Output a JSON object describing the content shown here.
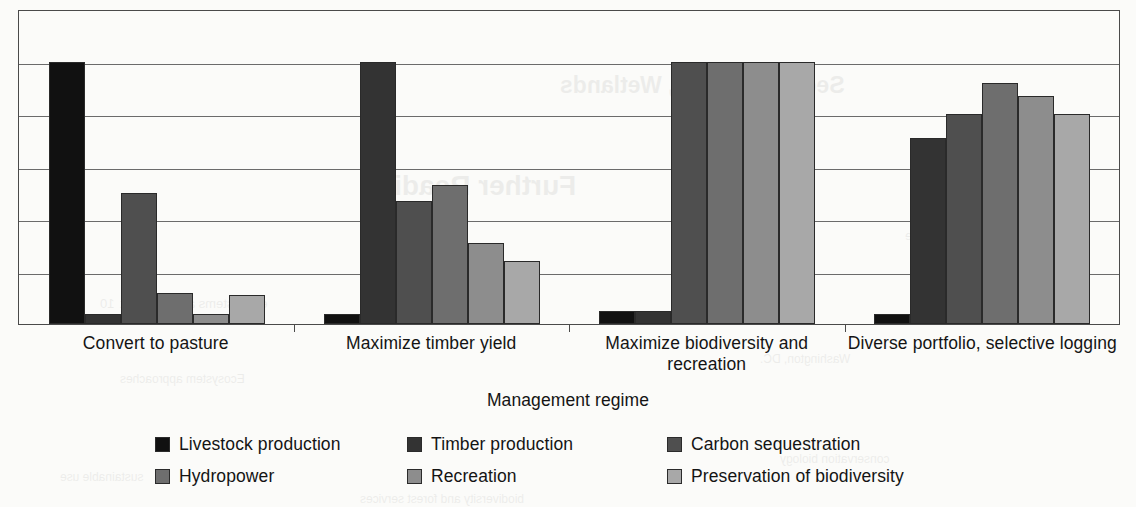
{
  "chart_data": {
    "type": "bar",
    "title": "",
    "xlabel": "Management regime",
    "ylabel": "",
    "ylim": [
      0,
      6
    ],
    "grid": true,
    "gridlines": 6,
    "y_tick_labels": [],
    "legend_position": "bottom",
    "categories": [
      "Convert to pasture",
      "Maximize timber yield",
      "Maximize biodiversity and recreation",
      "Diverse portfolio, selective logging"
    ],
    "series": [
      {
        "name": "Livestock production",
        "color": "#111111",
        "values": [
          5.0,
          0.2,
          0.25,
          0.2
        ]
      },
      {
        "name": "Timber production",
        "color": "#333333",
        "values": [
          0.2,
          5.0,
          0.25,
          3.55
        ]
      },
      {
        "name": "Carbon sequestration",
        "color": "#4f4f4f",
        "values": [
          2.5,
          2.35,
          5.0,
          4.0
        ]
      },
      {
        "name": "Hydropower",
        "color": "#6e6e6e",
        "values": [
          0.6,
          2.65,
          5.0,
          4.6
        ]
      },
      {
        "name": "Recreation",
        "color": "#8d8d8d",
        "values": [
          0.2,
          1.55,
          5.0,
          4.35
        ]
      },
      {
        "name": "Preservation of biodiversity",
        "color": "#a8a8a8",
        "values": [
          0.55,
          1.2,
          5.0,
          4.0
        ]
      }
    ]
  },
  "axis": {
    "x_title": "Management regime",
    "category_labels": [
      "Convert to pasture",
      "Maximize timber yield",
      "Maximize biodiversity and recreation",
      "Diverse portfolio, selective logging"
    ]
  },
  "legend": {
    "entries": [
      {
        "label": "Livestock production",
        "color": "#111111"
      },
      {
        "label": "Timber production",
        "color": "#333333"
      },
      {
        "label": "Carbon sequestration",
        "color": "#4f4f4f"
      },
      {
        "label": "Hydropower",
        "color": "#6e6e6e"
      },
      {
        "label": "Recreation",
        "color": "#8d8d8d"
      },
      {
        "label": "Preservation of biodiversity",
        "color": "#a8a8a8"
      }
    ]
  },
  "page_bleed": {
    "lines": [
      {
        "text": "See also Rivers, Wetlands",
        "x": 560,
        "y": 72,
        "size": 23,
        "weight": "700"
      },
      {
        "text": "Further Reading",
        "x": 360,
        "y": 170,
        "size": 28,
        "weight": "700"
      },
      {
        "text": "Duarte Inc. and the",
        "x": 905,
        "y": 228,
        "size": 13,
        "weight": "400"
      },
      {
        "text": "25",
        "x": 420,
        "y": 236,
        "size": 13,
        "weight": "400"
      },
      {
        "text": "20",
        "x": 420,
        "y": 255,
        "size": 13,
        "weight": "400"
      },
      {
        "text": "15",
        "x": 420,
        "y": 274,
        "size": 13,
        "weight": "400"
      },
      {
        "text": "10",
        "x": 100,
        "y": 296,
        "size": 13,
        "weight": "400"
      },
      {
        "text": "ecosystems and livestock",
        "x": 120,
        "y": 296,
        "size": 13,
        "weight": "400"
      },
      {
        "text": "Washington, DC.",
        "x": 760,
        "y": 352,
        "size": 12,
        "weight": "400"
      },
      {
        "text": "Ecosystem approaches",
        "x": 120,
        "y": 372,
        "size": 12,
        "weight": "400"
      },
      {
        "text": "conservation biology",
        "x": 780,
        "y": 452,
        "size": 12,
        "weight": "400"
      },
      {
        "text": "sustainable use",
        "x": 60,
        "y": 470,
        "size": 12,
        "weight": "400"
      },
      {
        "text": "biodiversity and forest services",
        "x": 360,
        "y": 492,
        "size": 12,
        "weight": "400"
      }
    ]
  }
}
